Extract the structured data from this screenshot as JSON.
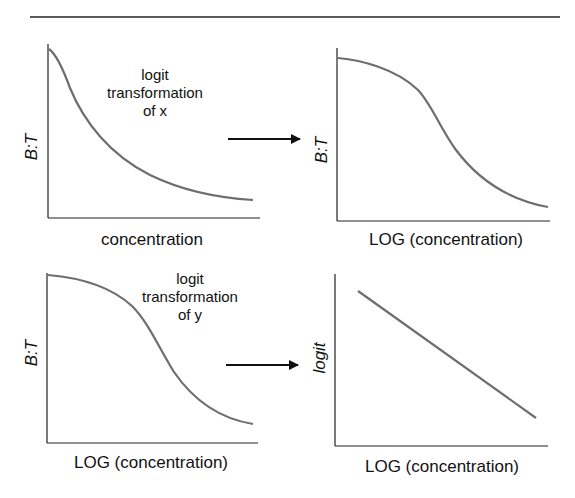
{
  "figure": {
    "panels": [
      {
        "id": "top-left",
        "ylabel": "B:T",
        "xlabel": "concentration",
        "curve": "exponential-decay"
      },
      {
        "id": "top-right",
        "ylabel": "B:T",
        "xlabel": "LOG (concentration)",
        "curve": "sigmoid-decreasing"
      },
      {
        "id": "bottom-left",
        "ylabel": "B:T",
        "xlabel": "LOG (concentration)",
        "curve": "sigmoid-decreasing"
      },
      {
        "id": "bottom-right",
        "ylabel": "logit",
        "xlabel": "LOG (concentration)",
        "curve": "linear-decreasing"
      }
    ],
    "transforms": [
      {
        "lines": [
          "logit",
          "transformation",
          "of x"
        ],
        "arrow": "right-arrow-icon"
      },
      {
        "lines": [
          "logit",
          "transformation",
          "of y"
        ],
        "arrow": "right-arrow-icon"
      }
    ],
    "colors": {
      "curve": "#6e6e6e",
      "axis": "#222222",
      "text": "#111111"
    }
  }
}
